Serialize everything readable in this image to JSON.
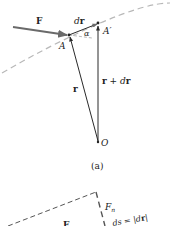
{
  "figure_a": {
    "caption": "(a)",
    "labels": {
      "force": "F",
      "displacement_d": "d",
      "displacement_r": "r",
      "angle": "α",
      "point_A": "A",
      "point_A_prime": "A′",
      "position_r": "r",
      "position_r_plus": "r + ",
      "position_dr_d": "d",
      "position_dr_r": "r",
      "origin": "O"
    }
  },
  "figure_b": {
    "labels": {
      "force": "F",
      "normal_component": "F",
      "normal_sub": "n",
      "ds_eq": "ds = |",
      "ds_d": "d",
      "ds_r": "r",
      "ds_close": "|"
    }
  },
  "colors": {
    "line": "#2a2a2a",
    "force_arrow": "#707070",
    "dashed_path": "#b8b8b8",
    "dashed_box": "#555555"
  }
}
